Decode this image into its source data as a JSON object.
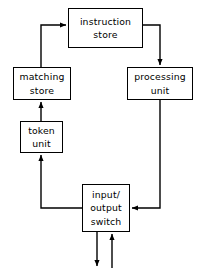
{
  "diagram": {
    "background_color": "#ffffff",
    "stroke_color": "#000000",
    "nodes": [
      {
        "id": "instruction-store",
        "lines": [
          "instruction",
          "store"
        ],
        "x": 68,
        "y": 8,
        "w": 75,
        "h": 40
      },
      {
        "id": "matching-store",
        "lines": [
          "matching",
          "store"
        ],
        "x": 13,
        "y": 67,
        "w": 58,
        "h": 33
      },
      {
        "id": "processing-unit",
        "lines": [
          "processing",
          "unit"
        ],
        "x": 127,
        "y": 67,
        "w": 66,
        "h": 33
      },
      {
        "id": "token-unit",
        "lines": [
          "token",
          "unit"
        ],
        "x": 20,
        "y": 121,
        "w": 43,
        "h": 32
      },
      {
        "id": "input-output-switch",
        "lines": [
          "input/",
          "output",
          "switch"
        ],
        "x": 82,
        "y": 184,
        "w": 48,
        "h": 48
      }
    ],
    "edges": [
      {
        "id": "matching-store-to-instruction-store",
        "label": "matching store to instruction store"
      },
      {
        "id": "instruction-store-to-processing-unit",
        "label": "instruction store to processing unit"
      },
      {
        "id": "processing-unit-to-input-output-switch",
        "label": "processing unit to input/output switch"
      },
      {
        "id": "input-output-switch-to-token-unit",
        "label": "input/output switch to token unit"
      },
      {
        "id": "token-unit-to-matching-store",
        "label": "token unit to matching store"
      },
      {
        "id": "input-output-switch-output",
        "label": "input/output switch external output"
      },
      {
        "id": "input-output-switch-input",
        "label": "external input to input/output switch"
      }
    ]
  }
}
